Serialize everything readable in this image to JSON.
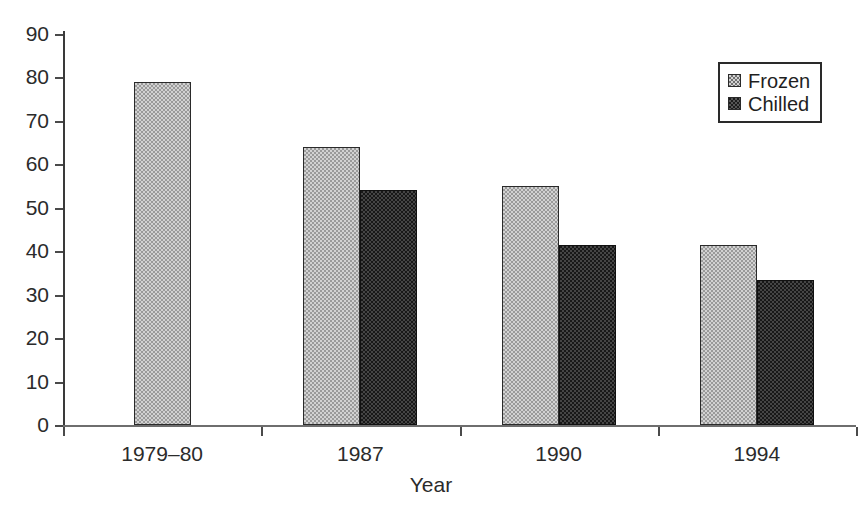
{
  "chart_data": {
    "type": "bar",
    "title": "",
    "subtitle": "",
    "xlabel": "Year",
    "ylabel": "",
    "categories": [
      "1979–80",
      "1987",
      "1990",
      "1994"
    ],
    "series": [
      {
        "name": "Frozen",
        "values": [
          79,
          64,
          55,
          41.5
        ]
      },
      {
        "name": "Chilled",
        "values": [
          null,
          54,
          41.5,
          33.3
        ]
      }
    ],
    "legend": [
      "Frozen",
      "Chilled"
    ],
    "legend_position": "top-right",
    "ylim": [
      0,
      90
    ],
    "yticks": [
      0,
      10,
      20,
      30,
      40,
      50,
      60,
      70,
      80,
      90
    ],
    "ytick_labels": [
      "0",
      "10",
      "20",
      "30",
      "40",
      "50",
      "60",
      "70",
      "80",
      "90"
    ],
    "grid": false,
    "colors": {
      "frozen_fill": "#d2d2d2",
      "frozen_pattern": "#9a9a9a",
      "chilled_fill": "#181818",
      "chilled_pattern": "#454545",
      "axis": "#3a3a3a",
      "text": "#2b2b2b",
      "background": "#ffffff"
    }
  },
  "axes": {
    "x_title": "Year",
    "y_title": ""
  },
  "legend": {
    "entries": [
      {
        "label": "Frozen",
        "swatch": "frozen-swatch-icon"
      },
      {
        "label": "Chilled",
        "swatch": "chilled-swatch-icon"
      }
    ]
  }
}
